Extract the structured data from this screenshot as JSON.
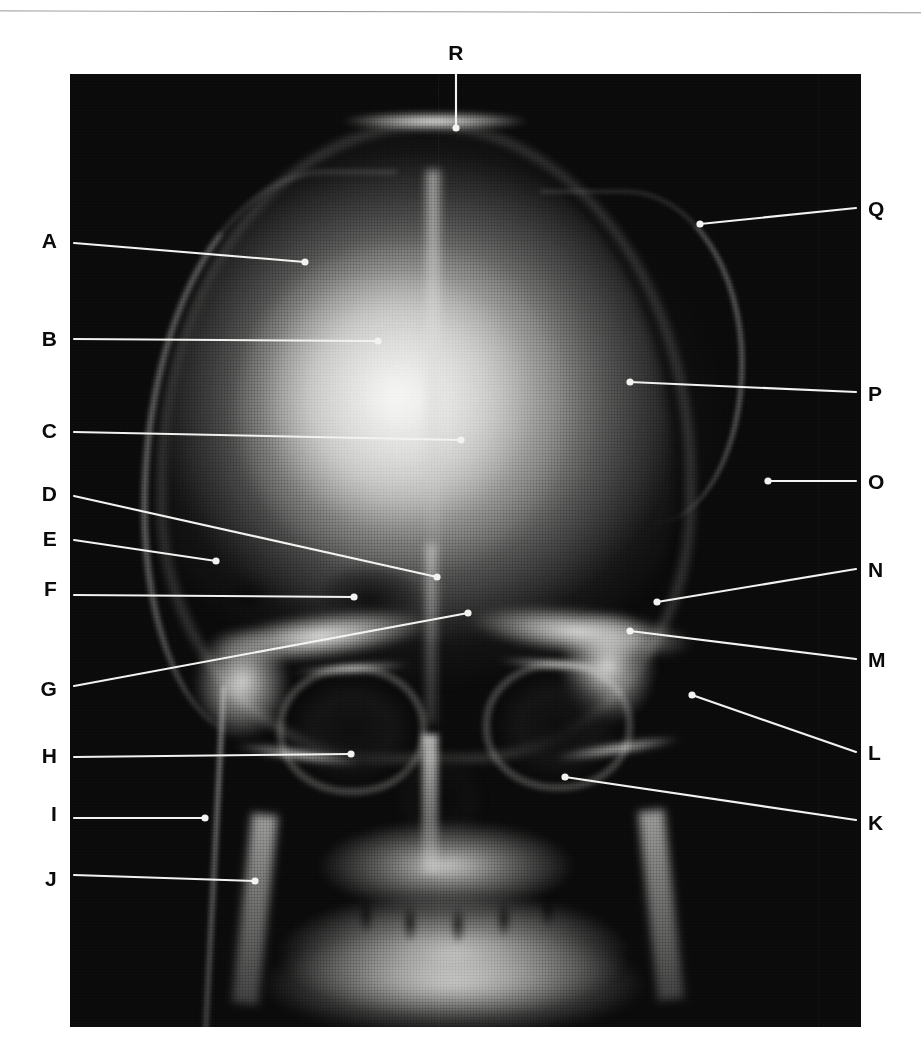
{
  "figure": {
    "kind": "radiograph-plate",
    "view": "skull-anteroposterior",
    "panel": {
      "x": 70,
      "y": 74,
      "width": 791,
      "height": 953,
      "background": "#090909"
    },
    "page_background": "#ffffff",
    "label_color": "#0b0b0b",
    "leader_color": "#f2f2f0"
  },
  "labels": [
    {
      "id": "R",
      "text": "R",
      "side": "top",
      "label_x": 456,
      "label_y": 52,
      "leader": {
        "x1": 456,
        "y1": 74,
        "x2": 456,
        "y2": 128
      }
    },
    {
      "id": "A",
      "text": "A",
      "side": "left",
      "label_x": 57,
      "label_y": 240,
      "leader": {
        "x1": 74,
        "y1": 243,
        "x2": 305,
        "y2": 262
      }
    },
    {
      "id": "B",
      "text": "B",
      "side": "left",
      "label_x": 57,
      "label_y": 338,
      "leader": {
        "x1": 74,
        "y1": 339,
        "x2": 378,
        "y2": 341
      }
    },
    {
      "id": "C",
      "text": "C",
      "side": "left",
      "label_x": 57,
      "label_y": 430,
      "leader": {
        "x1": 74,
        "y1": 432,
        "x2": 461,
        "y2": 440
      }
    },
    {
      "id": "D",
      "text": "D",
      "side": "left",
      "label_x": 57,
      "label_y": 493,
      "leader": {
        "x1": 74,
        "y1": 496,
        "x2": 437,
        "y2": 577
      }
    },
    {
      "id": "E",
      "text": "E",
      "side": "left",
      "label_x": 57,
      "label_y": 538,
      "leader": {
        "x1": 74,
        "y1": 540,
        "x2": 216,
        "y2": 561
      }
    },
    {
      "id": "F",
      "text": "F",
      "side": "left",
      "label_x": 57,
      "label_y": 588,
      "leader": {
        "x1": 74,
        "y1": 595,
        "x2": 354,
        "y2": 597
      }
    },
    {
      "id": "G",
      "text": "G",
      "side": "left",
      "label_x": 57,
      "label_y": 688,
      "leader": {
        "x1": 74,
        "y1": 686,
        "x2": 468,
        "y2": 613
      }
    },
    {
      "id": "H",
      "text": "H",
      "side": "left",
      "label_x": 57,
      "label_y": 755,
      "leader": {
        "x1": 74,
        "y1": 757,
        "x2": 351,
        "y2": 754
      }
    },
    {
      "id": "I",
      "text": "I",
      "side": "left",
      "label_x": 57,
      "label_y": 813,
      "leader": {
        "x1": 74,
        "y1": 818,
        "x2": 205,
        "y2": 818
      }
    },
    {
      "id": "J",
      "text": "J",
      "side": "left",
      "label_x": 57,
      "label_y": 878,
      "leader": {
        "x1": 74,
        "y1": 875,
        "x2": 255,
        "y2": 881
      }
    },
    {
      "id": "K",
      "text": "K",
      "side": "right",
      "label_x": 868,
      "label_y": 822,
      "leader": {
        "x1": 856,
        "y1": 820,
        "x2": 565,
        "y2": 777
      }
    },
    {
      "id": "L",
      "text": "L",
      "side": "right",
      "label_x": 868,
      "label_y": 752,
      "leader": {
        "x1": 856,
        "y1": 752,
        "x2": 692,
        "y2": 695
      }
    },
    {
      "id": "M",
      "text": "M",
      "side": "right",
      "label_x": 868,
      "label_y": 659,
      "leader": {
        "x1": 856,
        "y1": 659,
        "x2": 630,
        "y2": 631
      }
    },
    {
      "id": "N",
      "text": "N",
      "side": "right",
      "label_x": 868,
      "label_y": 569,
      "leader": {
        "x1": 856,
        "y1": 569,
        "x2": 657,
        "y2": 602
      }
    },
    {
      "id": "O",
      "text": "O",
      "side": "right",
      "label_x": 868,
      "label_y": 481,
      "leader": {
        "x1": 856,
        "y1": 481,
        "x2": 768,
        "y2": 481
      }
    },
    {
      "id": "P",
      "text": "P",
      "side": "right",
      "label_x": 868,
      "label_y": 393,
      "leader": {
        "x1": 856,
        "y1": 392,
        "x2": 630,
        "y2": 382
      }
    },
    {
      "id": "Q",
      "text": "Q",
      "side": "right",
      "label_x": 868,
      "label_y": 208,
      "leader": {
        "x1": 856,
        "y1": 208,
        "x2": 700,
        "y2": 224
      }
    }
  ]
}
